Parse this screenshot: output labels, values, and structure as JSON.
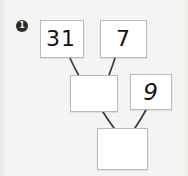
{
  "worksheet": {
    "item_number": "1",
    "marker_icon": "circled-number-one-icon",
    "background_color": "#f4f4f2",
    "box_border_color": "#b9b9bb",
    "box_fill_color": "#ffffff",
    "ink_color": "#111111",
    "connector_color": "#3a3a3a"
  },
  "diagram": {
    "type": "addition-pyramid",
    "boxes": [
      {
        "id": "a",
        "value": "31",
        "filled": true,
        "row": "top",
        "position": "left"
      },
      {
        "id": "b",
        "value": "7",
        "filled": true,
        "row": "top",
        "position": "right"
      },
      {
        "id": "c",
        "value": "",
        "filled": false,
        "row": "middle",
        "position": "left"
      },
      {
        "id": "d",
        "value": "9",
        "filled": true,
        "row": "middle",
        "position": "right"
      },
      {
        "id": "e",
        "value": "",
        "filled": false,
        "row": "bottom",
        "position": "center"
      }
    ],
    "connectors": [
      {
        "from": "a",
        "to": "c"
      },
      {
        "from": "b",
        "to": "c"
      },
      {
        "from": "c",
        "to": "e"
      },
      {
        "from": "d",
        "to": "e"
      }
    ]
  }
}
